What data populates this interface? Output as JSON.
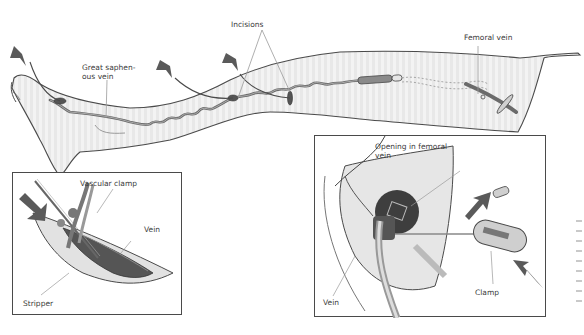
{
  "figure": {
    "main_view": {
      "labels": {
        "great_saphenous_vein": "Great saphen-\nous vein",
        "great_saphenous_vein_line1": "Great saphen-",
        "great_saphenous_vein_line2": "ous vein",
        "incisions": "Incisions",
        "femoral_vein": "Femoral vein"
      }
    },
    "inset_left": {
      "labels": {
        "vascular_clamp": "Vascular clamp",
        "vein": "Vein",
        "stripper": "Stripper"
      }
    },
    "inset_right": {
      "labels": {
        "opening_line1": "Opening in femoral",
        "opening_line2": "vein",
        "vein": "Vein",
        "clamp": "Clamp"
      }
    },
    "colors": {
      "outline": "#4a4a4a",
      "skin": "#efefef",
      "vein": "#6b6b6b",
      "arrow": "#5a5a5a",
      "label_text": "#3a3a3a"
    }
  }
}
